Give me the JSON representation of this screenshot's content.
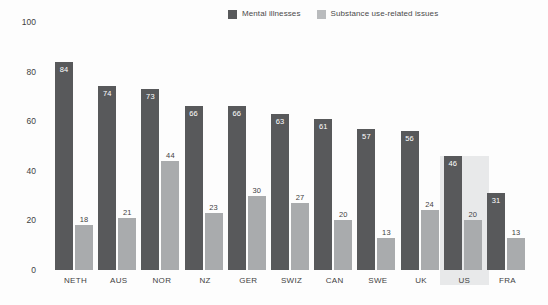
{
  "chart_data": {
    "type": "bar",
    "title": "",
    "subtitle": "",
    "xlabel": "",
    "ylabel": "",
    "ylim": [
      0,
      100
    ],
    "yticks": [
      0,
      20,
      40,
      60,
      80,
      100
    ],
    "grid": false,
    "legend_position": "top-center",
    "categories": [
      "NETH",
      "AUS",
      "NOR",
      "NZ",
      "GER",
      "SWIZ",
      "CAN",
      "SWE",
      "UK",
      "US",
      "FRA"
    ],
    "series": [
      {
        "name": "Mental illnesses",
        "color": "#58595b",
        "values": [
          84,
          74,
          73,
          66,
          66,
          63,
          61,
          57,
          56,
          46,
          31
        ]
      },
      {
        "name": "Substance use-related issues",
        "color": "#a9abad",
        "values": [
          18,
          21,
          44,
          23,
          30,
          27,
          20,
          13,
          24,
          20,
          13
        ]
      }
    ],
    "highlighted_category": "US",
    "highlight_color": "#e8e9ea"
  },
  "legend": {
    "items": [
      {
        "label": "Mental illnesses",
        "swatch": "dark"
      },
      {
        "label": "Substance use-related issues",
        "swatch": "light"
      }
    ]
  },
  "axis": {
    "y_tick_labels": [
      "100",
      "80",
      "60",
      "40",
      "20",
      "0"
    ]
  }
}
